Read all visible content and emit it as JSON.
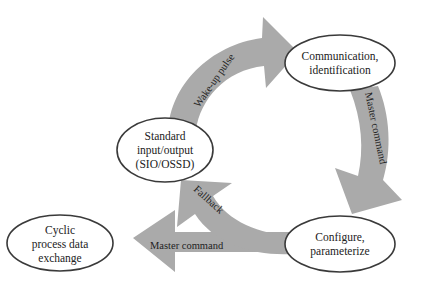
{
  "diagram": {
    "type": "state-cycle",
    "colors": {
      "arrow_fill": "#aaaaaa",
      "node_fill": "#ffffff",
      "node_stroke": "#3a3a3a",
      "text": "#222222"
    },
    "nodes": {
      "standard_io": {
        "lines": [
          "Standard",
          "input/output",
          "(SIO/OSSD)"
        ]
      },
      "communication": {
        "lines": [
          "Communication,",
          "identification"
        ]
      },
      "configure": {
        "lines": [
          "Configure,",
          "parameterize"
        ]
      },
      "cyclic": {
        "lines": [
          "Cyclic",
          "process data",
          "exchange"
        ]
      }
    },
    "arrows": {
      "wakeup": {
        "label": "Wake-up pulse",
        "from": "Standard input/output (SIO/OSSD)",
        "to": "Communication, identification"
      },
      "master_command_1": {
        "label": "Master command",
        "from": "Communication, identification",
        "to": "Configure, parameterize"
      },
      "fallback": {
        "label": "Fallback",
        "from": "Configure, parameterize",
        "to": "Standard input/output (SIO/OSSD)"
      },
      "master_command_2": {
        "label": "Master command",
        "from": "Configure, parameterize",
        "to": "Cyclic process data exchange"
      }
    }
  }
}
